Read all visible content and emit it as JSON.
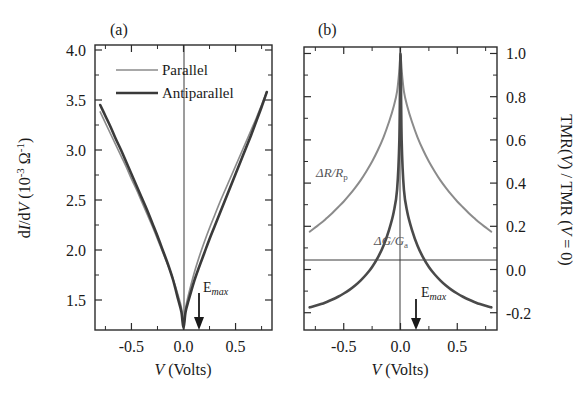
{
  "figure": {
    "background": "#ffffff",
    "panels": [
      "a",
      "b"
    ]
  },
  "panel_a": {
    "tag": "(a)",
    "xlabel_main": "V",
    "xlabel_units": " (Volts)",
    "ylabel_lead": "d",
    "ylabel_I": "I",
    "ylabel_mid": "/d",
    "ylabel_V": "V",
    "ylabel_units_open": " (10",
    "ylabel_exp1": "-3",
    "ylabel_ohm": " Ω",
    "ylabel_exp2": "-1",
    "ylabel_units_close": ")",
    "xticks": [
      "-0.5",
      "0.0",
      "0.5"
    ],
    "xtick_values": [
      -0.5,
      0.0,
      0.5
    ],
    "yticks": [
      "4.0",
      "3.5",
      "3.0",
      "2.5",
      "2.0",
      "1.5"
    ],
    "ytick_values": [
      4.0,
      3.5,
      3.0,
      2.5,
      2.0,
      1.5
    ],
    "legend": [
      {
        "label": "Parallel",
        "color": "#8b8b8b",
        "width": 1.7
      },
      {
        "label": "Antiparallel",
        "color": "#3a3a3a",
        "width": 2.6
      }
    ],
    "emax": {
      "label_base": "E",
      "label_sub": "max",
      "v_position": 0.13
    }
  },
  "panel_b": {
    "tag": "(b)",
    "xlabel_main": "V",
    "xlabel_units": " (Volts)",
    "ylabel_part1": "TMR(",
    "ylabel_V1": "V",
    "ylabel_part2": ") / TMR (",
    "ylabel_V2": "V",
    "ylabel_part3": " = 0)",
    "xticks": [
      "-0.5",
      "0.0",
      "0.5"
    ],
    "xtick_values": [
      -0.5,
      0.0,
      0.5
    ],
    "yticks": [
      "1.0",
      "0.8",
      "0.6",
      "0.4",
      "0.2",
      "0.0",
      "-0.2"
    ],
    "ytick_values": [
      1.0,
      0.8,
      0.6,
      0.4,
      0.2,
      0.0,
      -0.2
    ],
    "annotations": [
      {
        "base": "ΔR/R",
        "sub": "p",
        "color": "#8b8b8b"
      },
      {
        "base": "ΔG/G",
        "sub": "a",
        "color": "#4a4a4a"
      }
    ],
    "emax": {
      "label_base": "E",
      "label_sub": "max",
      "v_position": 0.13
    }
  },
  "chart_data": [
    {
      "type": "line",
      "panel": "a",
      "title": "(a)",
      "xlabel": "V (Volts)",
      "ylabel": "dI/dV (10^-3 Ohm^-1)",
      "xlim": [
        -0.85,
        0.85
      ],
      "ylim": [
        1.2,
        4.05
      ],
      "xticks": [
        -0.5,
        0.0,
        0.5
      ],
      "yticks": [
        4.0,
        3.5,
        3.0,
        2.5,
        2.0,
        1.5
      ],
      "grid": false,
      "legend_position": "top-center",
      "series": [
        {
          "name": "Parallel",
          "color": "#8b8b8b",
          "x": [
            -0.8,
            -0.75,
            -0.7,
            -0.65,
            -0.6,
            -0.55,
            -0.5,
            -0.45,
            -0.4,
            -0.35,
            -0.3,
            -0.25,
            -0.2,
            -0.15,
            -0.1,
            -0.05,
            -0.02,
            0.0,
            0.02,
            0.05,
            0.1,
            0.15,
            0.2,
            0.25,
            0.3,
            0.35,
            0.4,
            0.45,
            0.5,
            0.55,
            0.6,
            0.65,
            0.7,
            0.75,
            0.8
          ],
          "y": [
            3.38,
            3.27,
            3.16,
            3.05,
            2.94,
            2.83,
            2.71,
            2.6,
            2.48,
            2.36,
            2.24,
            2.11,
            1.98,
            1.85,
            1.71,
            1.54,
            1.42,
            1.24,
            1.42,
            1.56,
            1.76,
            1.93,
            2.08,
            2.22,
            2.35,
            2.48,
            2.6,
            2.72,
            2.84,
            2.96,
            3.08,
            3.2,
            3.32,
            3.45,
            3.58
          ]
        },
        {
          "name": "Antiparallel",
          "color": "#3a3a3a",
          "x": [
            -0.8,
            -0.75,
            -0.7,
            -0.65,
            -0.6,
            -0.55,
            -0.5,
            -0.45,
            -0.4,
            -0.35,
            -0.3,
            -0.25,
            -0.2,
            -0.15,
            -0.1,
            -0.05,
            -0.02,
            0.0,
            0.02,
            0.05,
            0.1,
            0.15,
            0.2,
            0.25,
            0.3,
            0.35,
            0.4,
            0.45,
            0.5,
            0.55,
            0.6,
            0.65,
            0.7,
            0.75,
            0.8
          ],
          "y": [
            3.45,
            3.34,
            3.23,
            3.11,
            3.0,
            2.88,
            2.76,
            2.64,
            2.52,
            2.4,
            2.27,
            2.14,
            2.0,
            1.86,
            1.7,
            1.5,
            1.38,
            1.22,
            1.38,
            1.5,
            1.68,
            1.83,
            1.97,
            2.11,
            2.24,
            2.37,
            2.5,
            2.63,
            2.76,
            2.89,
            3.02,
            3.15,
            3.29,
            3.43,
            3.58
          ]
        }
      ]
    },
    {
      "type": "line",
      "panel": "b",
      "title": "(b)",
      "xlabel": "V (Volts)",
      "ylabel": "TMR(V) / TMR (V = 0)",
      "xlim": [
        -0.85,
        0.85
      ],
      "ylim": [
        -0.28,
        1.03
      ],
      "xticks": [
        -0.5,
        0.0,
        0.5
      ],
      "yticks": [
        1.0,
        0.8,
        0.6,
        0.4,
        0.2,
        0.0,
        -0.2
      ],
      "grid": false,
      "legend_position": "inline-annotations",
      "series": [
        {
          "name": "ΔR/Rp",
          "color": "#8b8b8b",
          "x": [
            -0.8,
            -0.75,
            -0.7,
            -0.65,
            -0.6,
            -0.55,
            -0.5,
            -0.45,
            -0.4,
            -0.35,
            -0.3,
            -0.25,
            -0.2,
            -0.15,
            -0.1,
            -0.06,
            -0.03,
            -0.01,
            0.0,
            0.01,
            0.03,
            0.06,
            0.1,
            0.15,
            0.2,
            0.25,
            0.3,
            0.35,
            0.4,
            0.45,
            0.5,
            0.55,
            0.6,
            0.65,
            0.7,
            0.75,
            0.8
          ],
          "y": [
            0.175,
            0.195,
            0.215,
            0.238,
            0.262,
            0.288,
            0.315,
            0.345,
            0.378,
            0.414,
            0.455,
            0.5,
            0.552,
            0.612,
            0.685,
            0.755,
            0.825,
            0.925,
            1.0,
            0.925,
            0.825,
            0.755,
            0.685,
            0.612,
            0.552,
            0.5,
            0.455,
            0.414,
            0.378,
            0.345,
            0.315,
            0.288,
            0.262,
            0.238,
            0.215,
            0.195,
            0.175
          ]
        },
        {
          "name": "ΔG/Ga",
          "color": "#4a4a4a",
          "x": [
            -0.8,
            -0.75,
            -0.7,
            -0.65,
            -0.6,
            -0.55,
            -0.5,
            -0.45,
            -0.4,
            -0.35,
            -0.3,
            -0.25,
            -0.2,
            -0.15,
            -0.1,
            -0.06,
            -0.03,
            -0.01,
            0.0,
            0.01,
            0.03,
            0.06,
            0.1,
            0.15,
            0.2,
            0.25,
            0.3,
            0.35,
            0.4,
            0.45,
            0.5,
            0.55,
            0.6,
            0.65,
            0.7,
            0.75,
            0.8
          ],
          "y": [
            -0.175,
            -0.168,
            -0.16,
            -0.15,
            -0.139,
            -0.126,
            -0.111,
            -0.094,
            -0.074,
            -0.05,
            -0.022,
            0.012,
            0.055,
            0.11,
            0.185,
            0.265,
            0.37,
            0.6,
            1.0,
            0.6,
            0.37,
            0.265,
            0.185,
            0.11,
            0.055,
            0.012,
            -0.022,
            -0.05,
            -0.074,
            -0.094,
            -0.111,
            -0.126,
            -0.139,
            -0.15,
            -0.16,
            -0.168,
            -0.175
          ]
        }
      ]
    }
  ]
}
